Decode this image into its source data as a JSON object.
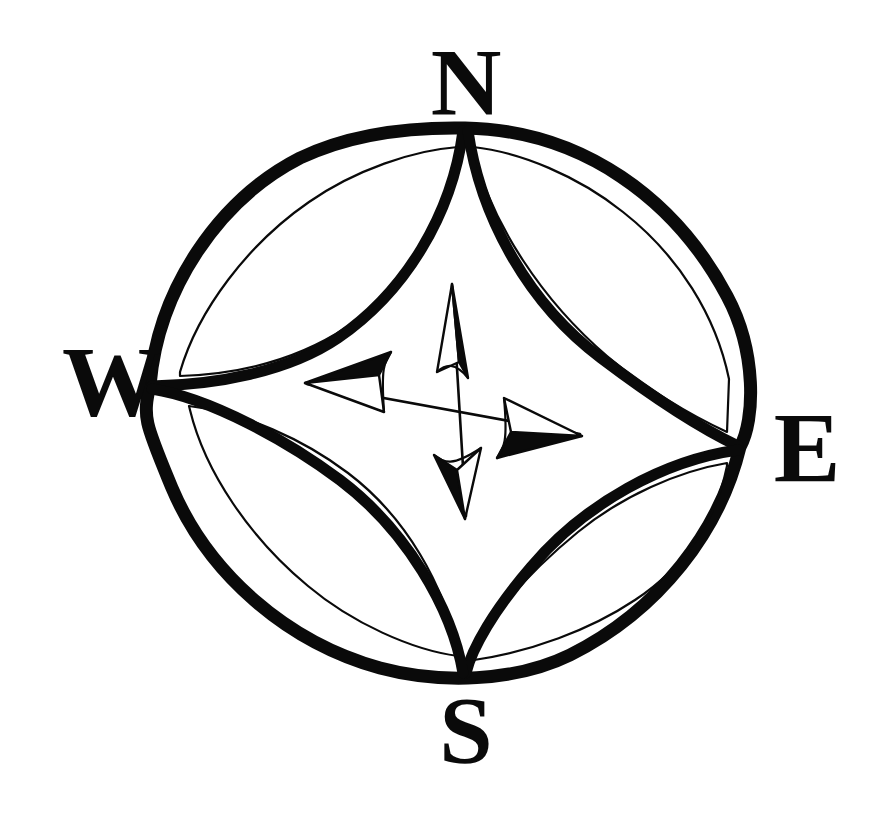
{
  "figure": {
    "kind": "compass-rose",
    "background_color": "#ffffff",
    "ink_color": "#0a0a0a"
  },
  "cardinals": {
    "north": "N",
    "east": "E",
    "south": "S",
    "west": "W"
  },
  "geometry": {
    "center_x": 455,
    "center_y": 400,
    "outer_radius_x": 295,
    "outer_radius_y": 274,
    "rim_stroke_width": 13,
    "petal_stroke_width": 11,
    "inner_line_stroke_width": 2.2,
    "vertex_north": "465,128",
    "vertex_east": "740,447",
    "vertex_south": "465,675",
    "vertex_west": "150,385"
  },
  "needles": {
    "north": {
      "direction": "up",
      "tip": "452,283",
      "filled_half": "right"
    },
    "east": {
      "direction": "right",
      "tip": "582,435",
      "filled_half": "lower"
    },
    "south": {
      "direction": "down",
      "tip": "465,518",
      "filled_half": "left"
    },
    "west": {
      "direction": "left",
      "tip": "305,383",
      "filled_half": "upper"
    }
  }
}
